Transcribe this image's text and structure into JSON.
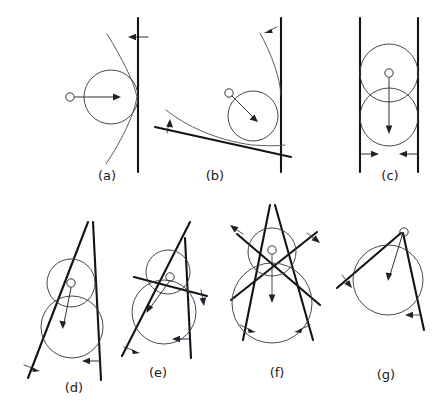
{
  "figure": {
    "background_color": "#ffffff",
    "line_color": "#141414",
    "circle_color": "#3c3c4a",
    "curve_color": "#4a4a58",
    "panel_count": 7
  },
  "panels": [
    {
      "id": "a",
      "label": "(a)",
      "label_x": 107,
      "label_y": 180,
      "center_label": "O",
      "description": "single vertical line with circle tangent from the left and a thin parabolic curve tangent at the contact point",
      "line_count": 1,
      "circle_count": 1,
      "arrow_count": 2
    },
    {
      "id": "b",
      "label": "(b)",
      "label_x": 215,
      "label_y": 180,
      "center_label": "O",
      "description": "vertical line and an oblique line with circle tangent to both; thin curves trace the offset loci",
      "line_count": 2,
      "circle_count": 1,
      "arrow_count": 3
    },
    {
      "id": "c",
      "label": "(c)",
      "label_x": 390,
      "label_y": 180,
      "center_label": "O",
      "description": "two parallel vertical lines with two overlapping inscribed circles and inward normals",
      "line_count": 2,
      "circle_count": 2,
      "arrow_count": 3
    },
    {
      "id": "d",
      "label": "(d)",
      "label_x": 74,
      "label_y": 392,
      "center_label": "O",
      "description": "two converging lines forming a wedge with two tangent circles stacked inside",
      "line_count": 2,
      "circle_count": 2,
      "arrow_count": 3
    },
    {
      "id": "e",
      "label": "(e)",
      "label_x": 158,
      "label_y": 377,
      "center_label": "O",
      "description": "three lines bounding a triangular region with two tangent circles",
      "line_count": 3,
      "circle_count": 2,
      "arrow_count": 4
    },
    {
      "id": "f",
      "label": "(f)",
      "label_x": 277,
      "label_y": 377,
      "center_label": "O",
      "description": "four lines in an X arrangement with two tangent circles nested in the crossing",
      "line_count": 4,
      "circle_count": 2,
      "arrow_count": 5
    },
    {
      "id": "g",
      "label": "(g)",
      "label_x": 386,
      "label_y": 379,
      "center_label": "O",
      "description": "two lines meeting at an apex with a circle inscribed in the corner",
      "line_count": 2,
      "circle_count": 1,
      "arrow_count": 3
    }
  ]
}
